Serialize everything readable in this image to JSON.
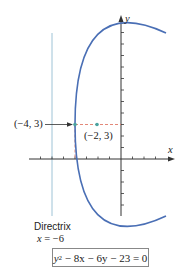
{
  "figure": {
    "axis_labels": {
      "x": "x",
      "y": "y"
    },
    "vertex": {
      "label": "(−4, 3)",
      "x": -4,
      "y": 3
    },
    "focus": {
      "label": "(−2, 3)",
      "x": -2,
      "y": 3
    },
    "directrix": {
      "title": "Directrix",
      "equation_lhs": "x",
      "equation_rhs": "= −6",
      "x": -6
    },
    "equation": {
      "y": "y",
      "exp": "2",
      "rest": " − 8x − 6y − 23 = 0"
    },
    "colors": {
      "parabola": "#4a6fb5",
      "directrix": "#9ec3d6",
      "dashed": "#e07a6a",
      "points": "#4aa3a0",
      "axes": "#333333"
    }
  }
}
